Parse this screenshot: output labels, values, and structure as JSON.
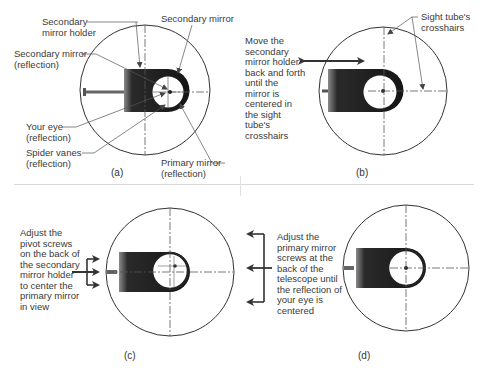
{
  "panels": {
    "a": {
      "caption": "(a)",
      "labels": {
        "secondary_mirror_holder": "Secondary\nmirror holder",
        "secondary_mirror": "Secondary mirror",
        "secondary_mirror_reflection": "Secondary mirror\n(reflection)",
        "your_eye": "Your eye\n(reflection)",
        "spider_vanes": "Spider vanes\n(reflection)",
        "primary_mirror": "Primary mirror\n(reflection)"
      }
    },
    "b": {
      "caption": "(b)",
      "instruction": "Move the\nsecondary\nmirror holder\nback and forth\nuntil the\nmirror is\ncentered in\nthe sight\ntube's\ncrosshairs",
      "labels": {
        "sight_tube_crosshairs": "Sight tube's\ncrosshairs"
      }
    },
    "c": {
      "caption": "(c)",
      "instruction": "Adjust the\npivot screws\non the back of\nthe secondary\nmirror holder\nto center the\nprimary mirror\nin view"
    },
    "d": {
      "caption": "(d)",
      "instruction": "Adjust the\nprimary mirror\nscrews at the\nback of the\ntelescope until\nthe reflection of\nyour eye is\ncentered"
    }
  },
  "colors": {
    "line": "#333333",
    "holder_dark": "#1e1e1e",
    "holder_light": "#7a7a7a",
    "separator": "#d8d8d8"
  }
}
